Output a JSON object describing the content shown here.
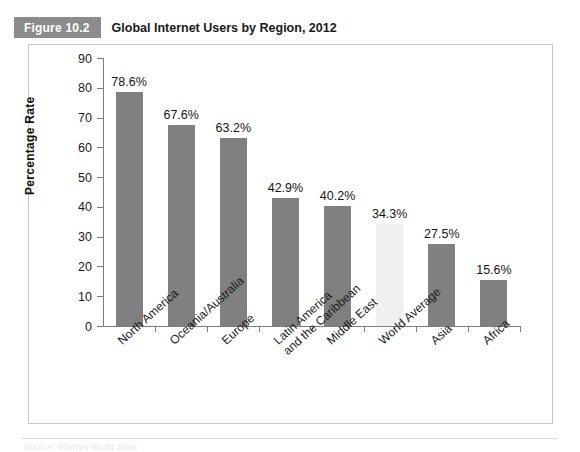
{
  "figure": {
    "badge": "Figure 10.2",
    "title": "Global Internet Users by Region, 2012"
  },
  "colors": {
    "badge_background": "#8c8c8c",
    "bar": "#808080",
    "bar_highlight": "#f0f0f0",
    "axis": "#7d7d7d",
    "frame_border": "#c9c9c9"
  },
  "chart_data": {
    "type": "bar",
    "title": "Global Internet Users by Region, 2012",
    "xlabel": "",
    "ylabel": "Percentage Rate",
    "ylim": [
      0,
      90
    ],
    "ytick_step": 10,
    "yticks": [
      90,
      80,
      70,
      60,
      50,
      40,
      30,
      20,
      10,
      0
    ],
    "grid": false,
    "legend": false,
    "categories": [
      "North America",
      "Oceania/Australia",
      "Europe",
      "Latin America and the Caribbean",
      "Middle East",
      "World Average",
      "Asia",
      "Africa"
    ],
    "values": [
      78.6,
      67.6,
      63.2,
      42.9,
      40.2,
      34.3,
      27.5,
      15.6
    ],
    "value_labels": [
      "78.6%",
      "67.6%",
      "63.2%",
      "42.9%",
      "40.2%",
      "34.3%",
      "27.5%",
      "15.6%"
    ],
    "highlight_index": 5,
    "bars": [
      {
        "label_line1": "North America",
        "label_line2": "",
        "value": 78.6,
        "value_label": "78.6%",
        "highlight": false
      },
      {
        "label_line1": "Oceania/Australia",
        "label_line2": "",
        "value": 67.6,
        "value_label": "67.6%",
        "highlight": false
      },
      {
        "label_line1": "Europe",
        "label_line2": "",
        "value": 63.2,
        "value_label": "63.2%",
        "highlight": false
      },
      {
        "label_line1": "Latin America",
        "label_line2": "and the Caribbean",
        "value": 42.9,
        "value_label": "42.9%",
        "highlight": false
      },
      {
        "label_line1": "Middle East",
        "label_line2": "",
        "value": 40.2,
        "value_label": "40.2%",
        "highlight": false
      },
      {
        "label_line1": "World Average",
        "label_line2": "",
        "value": 34.3,
        "value_label": "34.3%",
        "highlight": true
      },
      {
        "label_line1": "Asia",
        "label_line2": "",
        "value": 27.5,
        "value_label": "27.5%",
        "highlight": false
      },
      {
        "label_line1": "Africa",
        "label_line2": "",
        "value": 15.6,
        "value_label": "15.6%",
        "highlight": false
      }
    ]
  },
  "source": {
    "text": "Source: Internet World Stats"
  }
}
